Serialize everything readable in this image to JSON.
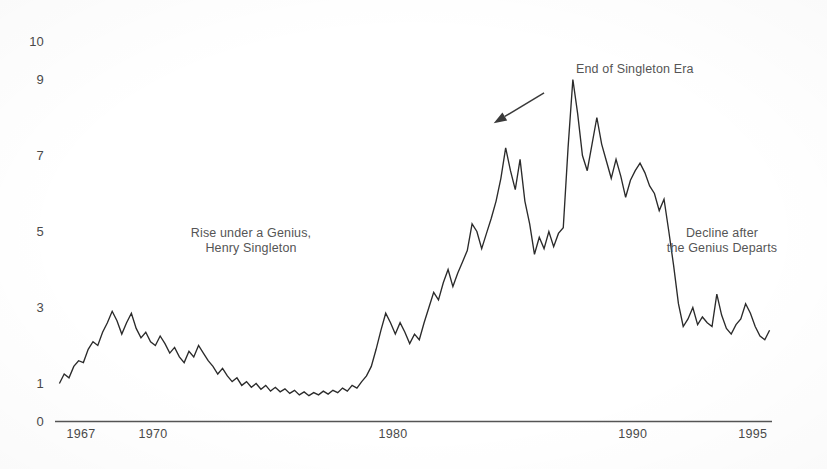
{
  "chart_data": {
    "type": "line",
    "title": "",
    "subtitle": "",
    "xlabel": "",
    "ylabel": "",
    "xlim": [
      1966.0,
      1995.8
    ],
    "ylim": [
      0,
      10
    ],
    "grid": false,
    "legend_position": "none",
    "x_ticks": [
      {
        "label": "1967",
        "value": 1967
      },
      {
        "label": "1970",
        "value": 1970
      },
      {
        "label": "1980",
        "value": 1980
      },
      {
        "label": "1990",
        "value": 1990
      },
      {
        "label": "1995",
        "value": 1995
      }
    ],
    "y_ticks": [
      {
        "label": "10",
        "value": 10
      },
      {
        "label": "9",
        "value": 9
      },
      {
        "label": "7",
        "value": 7
      },
      {
        "label": "5",
        "value": 5
      },
      {
        "label": "3",
        "value": 3
      },
      {
        "label": "1",
        "value": 1
      },
      {
        "label": "0",
        "value": 0
      }
    ],
    "series": [
      {
        "name": "Teledyne share price index",
        "color": "#2b2b2b",
        "x": [
          1966.1,
          1966.3,
          1966.5,
          1966.7,
          1966.9,
          1967.1,
          1967.3,
          1967.5,
          1967.7,
          1967.9,
          1968.1,
          1968.3,
          1968.5,
          1968.7,
          1968.9,
          1969.1,
          1969.3,
          1969.5,
          1969.7,
          1969.9,
          1970.1,
          1970.3,
          1970.5,
          1970.7,
          1970.9,
          1971.1,
          1971.3,
          1971.5,
          1971.7,
          1971.9,
          1972.1,
          1972.3,
          1972.5,
          1972.7,
          1972.9,
          1973.1,
          1973.3,
          1973.5,
          1973.7,
          1973.9,
          1974.1,
          1974.3,
          1974.5,
          1974.7,
          1974.9,
          1975.1,
          1975.3,
          1975.5,
          1975.7,
          1975.9,
          1976.1,
          1976.3,
          1976.5,
          1976.7,
          1976.9,
          1977.1,
          1977.3,
          1977.5,
          1977.7,
          1977.9,
          1978.1,
          1978.3,
          1978.5,
          1978.7,
          1978.9,
          1979.1,
          1979.3,
          1979.5,
          1979.7,
          1979.9,
          1980.1,
          1980.3,
          1980.5,
          1980.7,
          1980.9,
          1981.1,
          1981.3,
          1981.5,
          1981.7,
          1981.9,
          1982.1,
          1982.3,
          1982.5,
          1982.7,
          1982.9,
          1983.1,
          1983.3,
          1983.5,
          1983.7,
          1983.9,
          1984.1,
          1984.3,
          1984.5,
          1984.7,
          1984.9,
          1985.1,
          1985.3,
          1985.5,
          1985.7,
          1985.9,
          1986.1,
          1986.3,
          1986.5,
          1986.7,
          1986.9,
          1987.1,
          1987.3,
          1987.5,
          1987.7,
          1987.9,
          1988.1,
          1988.3,
          1988.5,
          1988.7,
          1988.9,
          1989.1,
          1989.3,
          1989.5,
          1989.7,
          1989.9,
          1990.1,
          1990.3,
          1990.5,
          1990.7,
          1990.9,
          1991.1,
          1991.3,
          1991.5,
          1991.7,
          1991.9,
          1992.1,
          1992.3,
          1992.5,
          1992.7,
          1992.9,
          1993.1,
          1993.3,
          1993.5,
          1993.7,
          1993.9,
          1994.1,
          1994.3,
          1994.5,
          1994.7,
          1994.9,
          1995.1,
          1995.3,
          1995.5,
          1995.7
        ],
        "y": [
          1.0,
          1.25,
          1.15,
          1.45,
          1.6,
          1.55,
          1.9,
          2.1,
          2.0,
          2.35,
          2.6,
          2.9,
          2.65,
          2.3,
          2.6,
          2.85,
          2.45,
          2.2,
          2.35,
          2.1,
          2.0,
          2.25,
          2.05,
          1.8,
          1.95,
          1.7,
          1.55,
          1.85,
          1.7,
          2.0,
          1.8,
          1.6,
          1.45,
          1.25,
          1.4,
          1.2,
          1.05,
          1.15,
          0.95,
          1.05,
          0.9,
          1.0,
          0.85,
          0.95,
          0.8,
          0.9,
          0.78,
          0.86,
          0.74,
          0.82,
          0.7,
          0.78,
          0.68,
          0.76,
          0.7,
          0.8,
          0.72,
          0.82,
          0.76,
          0.88,
          0.8,
          0.95,
          0.88,
          1.05,
          1.2,
          1.45,
          1.9,
          2.4,
          2.85,
          2.6,
          2.3,
          2.6,
          2.35,
          2.05,
          2.3,
          2.15,
          2.6,
          3.0,
          3.4,
          3.2,
          3.65,
          4.0,
          3.55,
          3.9,
          4.2,
          4.5,
          5.2,
          5.0,
          4.55,
          4.95,
          5.35,
          5.8,
          6.4,
          7.2,
          6.6,
          6.1,
          6.9,
          5.8,
          5.2,
          4.4,
          4.85,
          4.55,
          5.0,
          4.6,
          4.95,
          5.1,
          7.2,
          9.0,
          8.1,
          7.0,
          6.6,
          7.3,
          8.0,
          7.3,
          6.85,
          6.4,
          6.9,
          6.45,
          5.9,
          6.35,
          6.6,
          6.8,
          6.55,
          6.2,
          6.0,
          5.55,
          5.85,
          5.0,
          4.1,
          3.1,
          2.5,
          2.7,
          3.0,
          2.55,
          2.75,
          2.6,
          2.5,
          3.35,
          2.8,
          2.45,
          2.3,
          2.55,
          2.7,
          3.1,
          2.85,
          2.5,
          2.25,
          2.15,
          2.4
        ]
      }
    ],
    "annotations": [
      {
        "id": "left-annotation",
        "text": "Rise under a Genius,\nHenry Singleton",
        "x": 1973.8,
        "y": 5.2
      },
      {
        "id": "top-annotation",
        "text": "End of Singleton Era",
        "x": 1986.9,
        "y": 9.0,
        "arrow": {
          "from_x": 1986.3,
          "from_y": 8.65,
          "to_x": 1984.2,
          "to_y": 7.85
        }
      },
      {
        "id": "right-annotation",
        "text": "Decline after\nthe Genius Departs",
        "x": 1992.8,
        "y": 5.2
      }
    ]
  },
  "figure": {
    "background_color": "#ffffff",
    "line_color": "#2b2b2b",
    "axis_color": "#555555",
    "text_color": "#4a4a4a"
  }
}
